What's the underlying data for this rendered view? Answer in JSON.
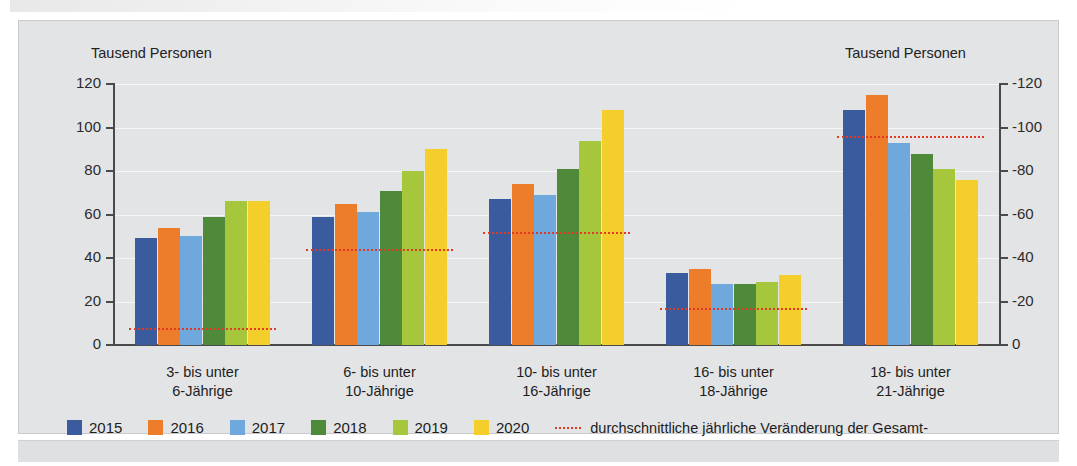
{
  "axis": {
    "left_title": "Tausend Personen",
    "right_title": "Tausend Personen",
    "left_ticks": [
      "120",
      "100",
      "80",
      "60",
      "40",
      "20",
      "0"
    ],
    "right_ticks": [
      "-120",
      "-100",
      "-80",
      "-60",
      "-40",
      "-20",
      "0"
    ]
  },
  "legend": {
    "years": [
      {
        "label": "2015",
        "color": "#3a5c9e"
      },
      {
        "label": "2016",
        "color": "#ee7d2b"
      },
      {
        "label": "2017",
        "color": "#6fa8dc"
      },
      {
        "label": "2018",
        "color": "#4f8a3a"
      },
      {
        "label": "2019",
        "color": "#a6c63c"
      },
      {
        "label": "2020",
        "color": "#f4cf2c"
      }
    ],
    "avg_line_note_1": "durchschnittliche jährliche Veränderung der Gesamt-",
    "avg_line_note_2": "bevölkerung von 2008 bis 2013 (rechte Skala)",
    "avg_line_color": "#e03a25"
  },
  "categories": [
    {
      "line1": "3- bis unter",
      "line2": "6-Jährige"
    },
    {
      "line1": "6- bis unter",
      "line2": "10-Jährige"
    },
    {
      "line1": "10- bis unter",
      "line2": "16-Jährige"
    },
    {
      "line1": "16- bis unter",
      "line2": "18-Jährige"
    },
    {
      "line1": "18- bis unter",
      "line2": "21-Jährige"
    }
  ],
  "chart_data": {
    "type": "bar",
    "title": "",
    "xlabel": "",
    "ylabel": "Tausend Personen",
    "ylabel_right": "Tausend Personen",
    "ylim": [
      0,
      120
    ],
    "ylim_right": [
      -120,
      0
    ],
    "yticks": [
      0,
      20,
      40,
      60,
      80,
      100,
      120
    ],
    "yticks_right": [
      -120,
      -100,
      -80,
      -60,
      -40,
      -20,
      0
    ],
    "grid": true,
    "legend_position": "bottom-left",
    "categories": [
      "3- bis unter 6-Jährige",
      "6- bis unter 10-Jährige",
      "10- bis unter 16-Jährige",
      "16- bis unter 18-Jährige",
      "18- bis unter 21-Jährige"
    ],
    "series": [
      {
        "name": "2015",
        "color": "#3a5c9e",
        "values": [
          49,
          59,
          67,
          33,
          108
        ]
      },
      {
        "name": "2016",
        "color": "#ee7d2b",
        "values": [
          54,
          65,
          74,
          35,
          115
        ]
      },
      {
        "name": "2017",
        "color": "#6fa8dc",
        "values": [
          50,
          61,
          69,
          28,
          93
        ]
      },
      {
        "name": "2018",
        "color": "#4f8a3a",
        "values": [
          59,
          71,
          81,
          28,
          88
        ]
      },
      {
        "name": "2019",
        "color": "#a6c63c",
        "values": [
          66,
          80,
          94,
          29,
          81
        ]
      },
      {
        "name": "2020",
        "color": "#f4cf2c",
        "values": [
          66,
          90,
          108,
          32,
          76
        ]
      }
    ],
    "overlay_line": {
      "name": "durchschnittliche jährliche Veränderung der Gesamtbevölkerung von 2008 bis 2013 (rechte Skala)",
      "color": "#e03a25",
      "style": "dotted",
      "axis": "right",
      "values": [
        -8,
        -44,
        -52,
        -17,
        -96
      ]
    }
  }
}
